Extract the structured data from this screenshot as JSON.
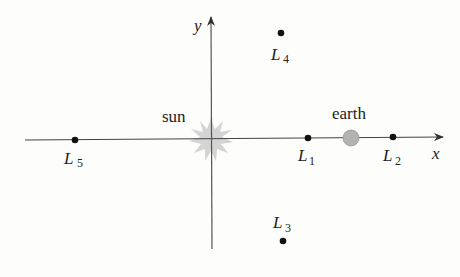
{
  "diagram": {
    "axes": {
      "x_label": "x",
      "y_label": "y"
    },
    "bodies": {
      "sun": {
        "label": "sun",
        "color": "#c8c8c8"
      },
      "earth": {
        "label": "earth",
        "color": "#b0b0b0"
      }
    },
    "points": [
      {
        "id": "L1",
        "letter": "L",
        "subscript": "1"
      },
      {
        "id": "L2",
        "letter": "L",
        "subscript": "2"
      },
      {
        "id": "L3",
        "letter": "L",
        "subscript": "3"
      },
      {
        "id": "L4",
        "letter": "L",
        "subscript": "4"
      },
      {
        "id": "L5",
        "letter": "L",
        "subscript": "5"
      }
    ],
    "colors": {
      "axis": "#444444",
      "point": "#111111",
      "text": "#222222"
    }
  }
}
